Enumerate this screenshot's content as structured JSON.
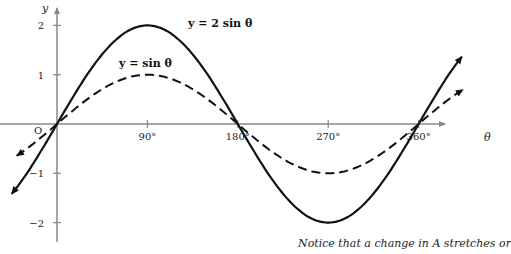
{
  "chart_data": {
    "type": "line",
    "title": "",
    "xlabel": "θ",
    "ylabel": "y",
    "x_ticks": [
      "90°",
      "180°",
      "270°",
      "360°"
    ],
    "y_ticks": [
      "2",
      "1",
      "−1",
      "−2"
    ],
    "origin_label": "O",
    "xlim": [
      -60,
      400
    ],
    "ylim": [
      -2.4,
      2.4
    ],
    "grid": false,
    "series": [
      {
        "name": "y = 2 sin θ",
        "style": "solid",
        "amplitude": 2,
        "x": [
          0,
          90,
          180,
          270,
          360
        ],
        "values": [
          0,
          2,
          0,
          -2,
          0
        ]
      },
      {
        "name": "y = sin θ",
        "style": "dashed",
        "amplitude": 1,
        "x": [
          0,
          90,
          180,
          270,
          360
        ],
        "values": [
          0,
          1,
          0,
          -1,
          0
        ]
      }
    ],
    "annotations": [
      "y = 2 sin θ",
      "y = sin θ"
    ]
  },
  "caption": "Notice that a change in A stretches or"
}
